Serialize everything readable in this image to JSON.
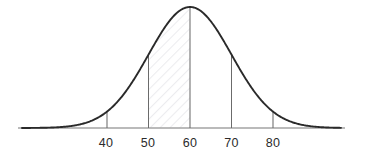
{
  "chart_data": {
    "type": "line",
    "title": "",
    "subtitle": "",
    "xlabel": "",
    "ylabel": "",
    "curve": "normal-distribution",
    "distribution": {
      "mean": 60,
      "std_dev": 10,
      "peak_value": 60
    },
    "xlim": [
      25,
      95
    ],
    "ylim": [
      0,
      1
    ],
    "grid": false,
    "legend": null,
    "categories": [
      "40",
      "50",
      "60",
      "70",
      "80"
    ],
    "tick_values": [
      40,
      50,
      60,
      70,
      80
    ],
    "tick_labels": [
      "40",
      "50",
      "60",
      "70",
      "80"
    ],
    "values": [
      0.1353,
      0.6065,
      1.0,
      0.6065,
      0.1353
    ],
    "annotations": [
      {
        "name": "shaded-region",
        "kind": "hatched-area",
        "from": 50,
        "to": 60,
        "label": ""
      }
    ],
    "vertical_markers": [
      40,
      50,
      60,
      70,
      80
    ],
    "axis_line": true
  },
  "colors": {
    "background": "#ffffff",
    "curve": "#2a2a2a",
    "axis": "#a0a0a0",
    "marker_line": "#6b6b6b",
    "tick_label": "#2b2b2b",
    "hatch": "#ececed"
  },
  "geometry": {
    "width": 369,
    "height": 158,
    "baseline_y": 128,
    "peak_y": 7,
    "axis_x_start": 18,
    "axis_x_end": 345,
    "center_x": 190,
    "unit_px_per_10": 41.5,
    "tick_x": [
      106,
      148,
      190,
      231.5,
      273
    ],
    "label_y": 147
  }
}
